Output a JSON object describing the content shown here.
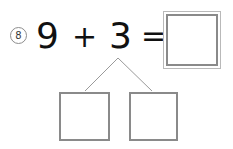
{
  "worksheet": {
    "problem_number": "8",
    "problem_type": "number-bond-addition",
    "equation": {
      "addend_a": "9",
      "operator": "+",
      "addend_b": "3",
      "equals": "=",
      "sum_value": ""
    },
    "answer_box": {
      "value": "",
      "border_color_outer": "#b9b9b9",
      "border_color_inner": "#8a8a8a"
    },
    "number_bond": {
      "whole_label": "3",
      "apex": {
        "x": 118,
        "y": 58
      },
      "branch_left_end": {
        "x": 85,
        "y": 91
      },
      "branch_right_end": {
        "x": 152,
        "y": 91
      },
      "line_color": "#9a9a9a",
      "parts": [
        {
          "name": "part-left",
          "value": ""
        },
        {
          "name": "part-right",
          "value": ""
        }
      ]
    },
    "colors": {
      "background": "#ffffff",
      "text": "#111111",
      "box_border": "#8a8a8a",
      "circle_border": "#8d8d8d"
    }
  }
}
